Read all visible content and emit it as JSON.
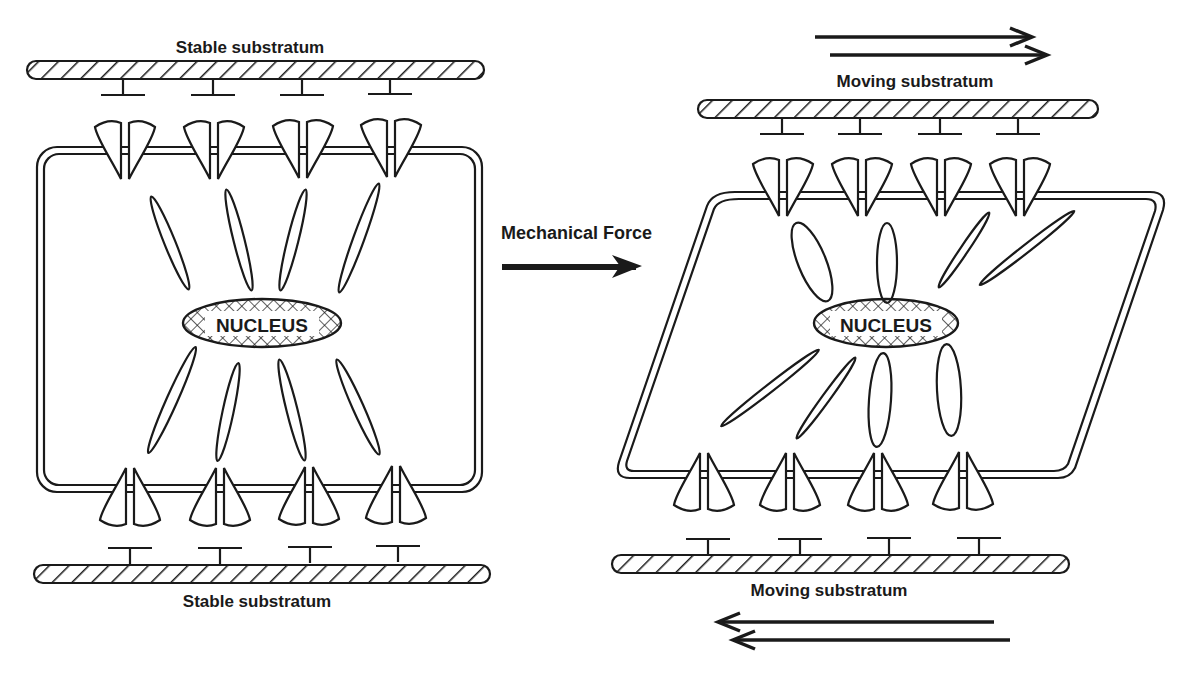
{
  "diagram": {
    "left_panel": {
      "state": "stable",
      "top_label": "Stable substratum",
      "bottom_label": "Stable substratum",
      "nucleus_label": "NUCLEUS",
      "adhesion_sites_top": 4,
      "adhesion_sites_bottom": 4,
      "cytoskeletal_filaments": 8
    },
    "center": {
      "label": "Mechanical Force",
      "arrow_direction": "right"
    },
    "right_panel": {
      "state": "sheared",
      "top_label": "Moving substratum",
      "bottom_label": "Moving substratum",
      "nucleus_label": "NUCLEUS",
      "top_motion": "right",
      "bottom_motion": "left",
      "adhesion_sites_top": 4,
      "adhesion_sites_bottom": 4,
      "cytoskeletal_filaments": 8
    },
    "colors": {
      "ink": "#1a1a1a",
      "background": "#ffffff"
    }
  }
}
